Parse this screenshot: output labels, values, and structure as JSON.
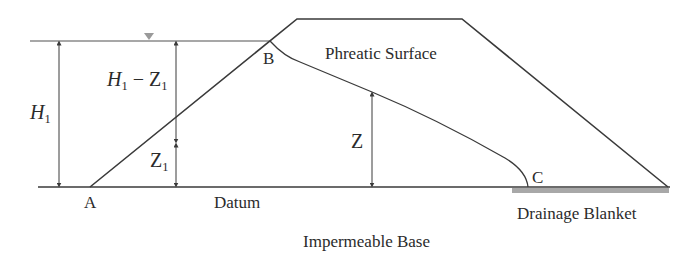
{
  "diagram": {
    "colors": {
      "line": "#3a3a3a",
      "water_line": "#8a8a8a",
      "water_marker": "#9a9a9a",
      "drainage_blanket": "#a8a8a8",
      "text": "#2b2b2b"
    },
    "points": {
      "A": "A",
      "B": "B",
      "C": "C"
    },
    "labels": {
      "phreatic_surface": "Phreatic Surface",
      "datum": "Datum",
      "drainage_blanket": "Drainage Blanket",
      "impermeable_base": "Impermeable Base"
    },
    "dimensions": {
      "H1": {
        "symbol": "H",
        "sub": "1"
      },
      "H1_minus_Z1": {
        "symbol": "H",
        "sub": "1",
        "minus": " − ",
        "symbol2": "Z",
        "sub2": "1"
      },
      "Z1": {
        "symbol": "Z",
        "sub": "1"
      },
      "Z": {
        "symbol": "Z"
      }
    },
    "water_level_icon": "water-level-triangle"
  }
}
